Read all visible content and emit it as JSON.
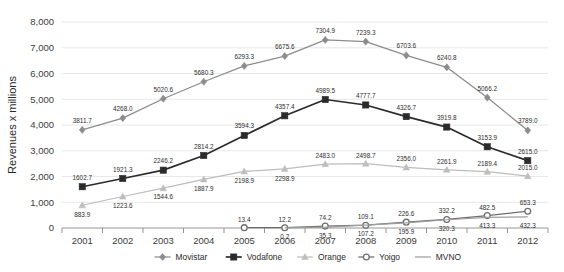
{
  "chart_data": {
    "type": "line",
    "title": "",
    "subtitle": "",
    "xlabel": "",
    "ylabel": "Revenues x millions",
    "categories": [
      "2001",
      "2002",
      "2003",
      "2004",
      "2005",
      "2006",
      "2007",
      "2008",
      "2009",
      "2010",
      "2011",
      "2012"
    ],
    "ylim": [
      0,
      8000
    ],
    "yticks": [
      "0",
      "1,000",
      "2,000",
      "3,000",
      "4,000",
      "5,000",
      "6,000",
      "7,000",
      "8,000"
    ],
    "ytick_values": [
      0,
      1000,
      2000,
      3000,
      4000,
      5000,
      6000,
      7000,
      8000
    ],
    "grid": true,
    "legend_position": "bottom",
    "series": [
      {
        "name": "Movistar",
        "color": "#8c8c8c",
        "marker": "diamond",
        "values": [
          3811.7,
          4268.0,
          5020.6,
          5680.3,
          6293.3,
          6675.6,
          7304.9,
          7239.3,
          6703.6,
          6240.8,
          5066.2,
          3789.0
        ],
        "labels": [
          "3811.7",
          "4268.0",
          "5020.6",
          "5680.3",
          "6293.3",
          "6675.6",
          "7304.9",
          "7239.3",
          "6703.6",
          "6240.8",
          "5066.2",
          "3789.0"
        ]
      },
      {
        "name": "Vodafone",
        "color": "#2b2b2b",
        "marker": "square",
        "values": [
          1602.7,
          1921.3,
          2246.2,
          2814.2,
          3594.3,
          4357.4,
          4989.5,
          4777.7,
          4326.7,
          3919.8,
          3153.9,
          2615.0
        ],
        "labels": [
          "1602.7",
          "1921.3",
          "2246.2",
          "2814.2",
          "3594.3",
          "4357.4",
          "4989.5",
          "4777.7",
          "4326.7",
          "3919.8",
          "3153.9",
          "2615.0"
        ]
      },
      {
        "name": "Orange",
        "color": "#bdbdbd",
        "marker": "triangle",
        "values": [
          883.9,
          1223.6,
          1544.6,
          1887.9,
          2198.9,
          2298.9,
          2483.0,
          2498.7,
          2356.0,
          2261.9,
          2189.4,
          2015.0
        ],
        "labels": [
          "883.9",
          "1223.6",
          "1544.6",
          "1887.9",
          "2198.9",
          "2298.9",
          "2483.0",
          "2498.7",
          "2356.0",
          "2261.9",
          "2189.4",
          "2015.0"
        ]
      },
      {
        "name": "Yoigo",
        "color": "#6e6e6e",
        "marker": "circle",
        "values": [
          null,
          null,
          null,
          null,
          13.4,
          12.2,
          74.2,
          109.1,
          226.6,
          332.2,
          482.5,
          653.3
        ],
        "labels": [
          "",
          "",
          "",
          "",
          "13.4",
          "12.2",
          "74.2",
          "109.1",
          "226.6",
          "332.2",
          "482.5",
          "653.3"
        ]
      },
      {
        "name": "MVNO",
        "color": "#9e9e9e",
        "marker": "none",
        "values": [
          null,
          null,
          null,
          null,
          null,
          0.2,
          35.3,
          107.2,
          195.9,
          320.3,
          413.3,
          432.3
        ],
        "labels": [
          "",
          "",
          "",
          "",
          "",
          "0.2",
          "35.3",
          "107.2",
          "195.9",
          "320.3",
          "413.3",
          "432.3"
        ]
      }
    ]
  },
  "legend": {
    "items": [
      {
        "label": "Movistar"
      },
      {
        "label": "Vodafone"
      },
      {
        "label": "Orange"
      },
      {
        "label": "Yoigo"
      },
      {
        "label": "MVNO"
      }
    ]
  }
}
